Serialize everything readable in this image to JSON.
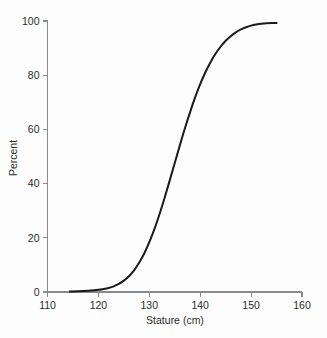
{
  "chart_data": {
    "type": "line",
    "title": "",
    "subtitle": "",
    "xlabel": "Stature (cm)",
    "ylabel": "Percent",
    "xlim": [
      110,
      160
    ],
    "ylim": [
      0,
      100
    ],
    "xticks": [
      110,
      120,
      130,
      140,
      150,
      160
    ],
    "xtick_labels": [
      "110",
      "120",
      "130",
      "140",
      "150",
      "160"
    ],
    "yticks": [
      0,
      20,
      40,
      60,
      80,
      100
    ],
    "ytick_labels": [
      "0",
      "20",
      "40",
      "60",
      "80",
      "100"
    ],
    "grid": false,
    "legend": "none",
    "annotations": [],
    "series": [
      {
        "name": "Cumulative percent",
        "color": "#1a1a1a",
        "x": [
          114.4,
          116,
          118,
          120,
          121,
          122,
          123,
          124,
          125,
          126,
          127,
          128,
          129,
          130,
          131,
          132,
          133,
          134,
          135,
          136,
          137,
          138,
          139,
          140,
          141,
          142,
          143,
          144,
          145,
          146,
          147,
          148,
          149,
          150,
          151,
          152,
          153,
          154,
          155
        ],
        "y": [
          0.2,
          0.3,
          0.5,
          0.8,
          1.1,
          1.5,
          2.1,
          3.0,
          4.2,
          5.8,
          8.0,
          10.8,
          14.2,
          18.4,
          23.2,
          28.7,
          34.7,
          41.1,
          47.6,
          54.1,
          60.4,
          66.3,
          71.8,
          76.7,
          81.0,
          84.7,
          87.9,
          90.5,
          92.7,
          94.4,
          95.8,
          96.9,
          97.7,
          98.3,
          98.7,
          99.0,
          99.2,
          99.3,
          99.3
        ]
      }
    ],
    "colors": {
      "background": "#fdfdfd",
      "axis": "#8a8a8a",
      "text": "#2b2b2b",
      "curve": "#1a1a1a"
    }
  }
}
